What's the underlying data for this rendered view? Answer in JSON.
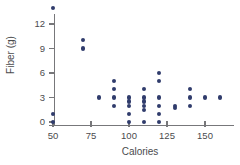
{
  "chart_data": {
    "type": "scatter",
    "title": "",
    "xlabel": "Calories",
    "ylabel": "Fiber (g)",
    "xlim": [
      38,
      172
    ],
    "ylim": [
      -1.2,
      15
    ],
    "xticks": [
      50,
      75,
      100,
      125,
      150
    ],
    "yticks": [
      0,
      3,
      6,
      9,
      12
    ],
    "xticklabels": [
      "50",
      "75",
      "100",
      "125",
      "150"
    ],
    "yticklabels": [
      "0",
      "3",
      "6",
      "9",
      "12"
    ],
    "grid": false,
    "legend": null,
    "marker_color": "#303c6c",
    "axis_color": "#77777a",
    "points": [
      {
        "x": 50,
        "y": 14
      },
      {
        "x": 50,
        "y": 1
      },
      {
        "x": 50,
        "y": 0
      },
      {
        "x": 70,
        "y": 10
      },
      {
        "x": 70,
        "y": 9
      },
      {
        "x": 80,
        "y": 3
      },
      {
        "x": 90,
        "y": 5
      },
      {
        "x": 90,
        "y": 4
      },
      {
        "x": 90,
        "y": 3
      },
      {
        "x": 90,
        "y": 2
      },
      {
        "x": 100,
        "y": 3
      },
      {
        "x": 100,
        "y": 2.5
      },
      {
        "x": 100,
        "y": 2
      },
      {
        "x": 100,
        "y": 1
      },
      {
        "x": 100,
        "y": 0
      },
      {
        "x": 110,
        "y": 4
      },
      {
        "x": 110,
        "y": 3
      },
      {
        "x": 110,
        "y": 2.5
      },
      {
        "x": 110,
        "y": 2
      },
      {
        "x": 110,
        "y": 1.5
      },
      {
        "x": 110,
        "y": 0
      },
      {
        "x": 120,
        "y": 6
      },
      {
        "x": 120,
        "y": 5
      },
      {
        "x": 120,
        "y": 3
      },
      {
        "x": 120,
        "y": 2
      },
      {
        "x": 120,
        "y": 1
      },
      {
        "x": 120,
        "y": 0
      },
      {
        "x": 130,
        "y": 2
      },
      {
        "x": 130,
        "y": 1.7
      },
      {
        "x": 140,
        "y": 4
      },
      {
        "x": 140,
        "y": 3
      },
      {
        "x": 140,
        "y": 2
      },
      {
        "x": 150,
        "y": 3
      },
      {
        "x": 160,
        "y": 3
      }
    ]
  }
}
